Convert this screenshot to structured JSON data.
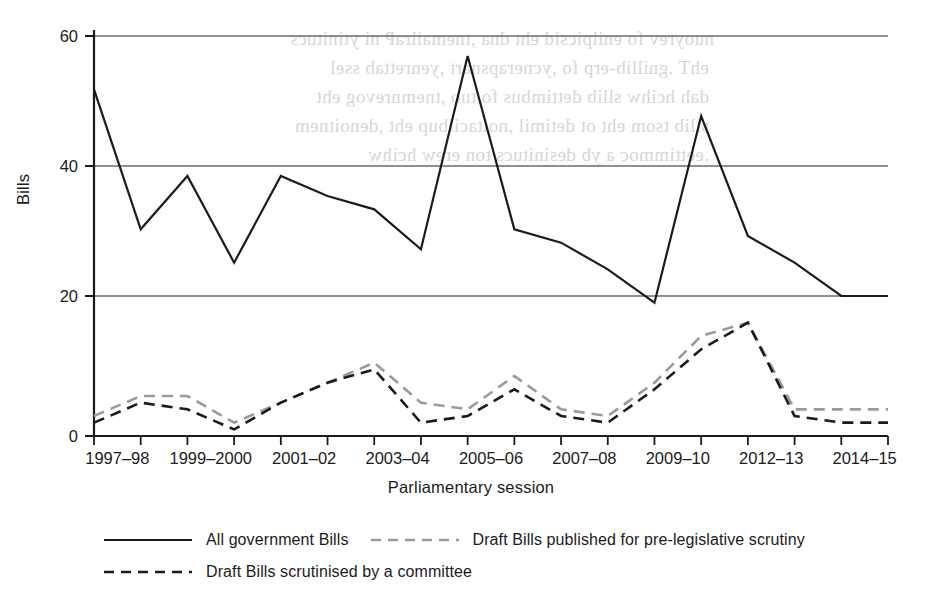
{
  "chart_data": {
    "type": "line",
    "title": "",
    "xlabel": "Parliamentary session",
    "ylabel": "Bills",
    "ylim": [
      0,
      60
    ],
    "yticks": [
      0,
      20,
      40,
      60
    ],
    "grid": true,
    "legend_position": "bottom",
    "categories": [
      "1997–98",
      "1998–99",
      "1999–2000",
      "2000–01",
      "2001–02",
      "2002–03",
      "2003–04",
      "2004–05",
      "2005–06",
      "2006–07",
      "2007–08",
      "2008–09",
      "2009–10",
      "2010–12",
      "2012–13",
      "2013–14",
      "2014–15",
      "2015–16"
    ],
    "tick_labels": [
      "1997–98",
      "",
      "1999–2000",
      "",
      "2001–02",
      "",
      "2003–04",
      "",
      "2005–06",
      "",
      "2007–08",
      "",
      "2009–10",
      "",
      "2012–13",
      "",
      "2014–15",
      ""
    ],
    "visible_tick_labels": [
      "1997–98",
      "1999–2000",
      "2001–02",
      "2003–04",
      "2005–06",
      "2007–08",
      "2009–10",
      "2012–13",
      "2014–15"
    ],
    "series": [
      {
        "name": "All government Bills",
        "style": "solid",
        "color": "#1b1b1b",
        "values": [
          52,
          31,
          39,
          26,
          39,
          36,
          34,
          28,
          57,
          31,
          29,
          25,
          20,
          48,
          30,
          26,
          21,
          21
        ]
      },
      {
        "name": "Draft Bills published for pre-legislative scrutiny",
        "style": "dashed",
        "color": "#9a9a9a",
        "values": [
          3,
          6,
          6,
          2,
          5,
          8,
          11,
          5,
          4,
          9,
          4,
          3,
          8,
          15,
          17,
          4,
          4,
          4
        ]
      },
      {
        "name": "Draft Bills scrutinised by a committee",
        "style": "dashed",
        "color": "#1b1b1b",
        "values": [
          2,
          5,
          4,
          1,
          5,
          8,
          10,
          2,
          3,
          7,
          3,
          2,
          7,
          13,
          17,
          3,
          2,
          2
        ]
      }
    ]
  },
  "axis": {
    "y_title": "Bills",
    "x_title": "Parliamentary session"
  },
  "legend": {
    "row1": [
      {
        "label": "All government Bills",
        "style": "solid",
        "color": "#1b1b1b"
      },
      {
        "label": "Draft Bills published for pre-legislative scrutiny",
        "style": "dashed",
        "color": "#9a9a9a"
      }
    ],
    "row2": [
      {
        "label": "Draft Bills scrutinised by a committee",
        "style": "dashed",
        "color": "#1b1b1b"
      }
    ]
  },
  "colors": {
    "solid_line": "#1b1b1b",
    "grid": "#666666",
    "axis": "#1b1b1b",
    "light_dashed": "#9a9a9a",
    "dark_dashed": "#1b1b1b",
    "background": "#ffffff"
  }
}
